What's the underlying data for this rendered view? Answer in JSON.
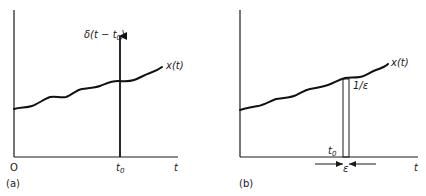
{
  "panels": [
    {
      "id": "a",
      "caption": "(a)",
      "origin_label": "O",
      "t_axis_label": "t",
      "t0_tick_label": "t",
      "t0_tick_sub": "0",
      "signal_label": "x(t)",
      "impulse_label": "δ(t − t",
      "impulse_label_sub": "0",
      "impulse_label_close": ")"
    },
    {
      "id": "b",
      "caption": "(b)",
      "t_axis_label": "t",
      "t0_label": "t",
      "t0_sub": "0",
      "signal_label": "x(t)",
      "height_label": "1/ε",
      "width_label": "ε"
    }
  ],
  "colors": {
    "ink": "#111111",
    "background": "#ffffff"
  }
}
